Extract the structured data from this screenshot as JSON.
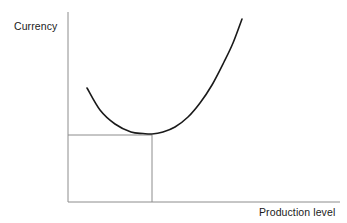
{
  "figure": {
    "background_color": "#ffffff",
    "width": 347,
    "height": 223
  },
  "labels": {
    "y_axis": "Currency",
    "x_axis": "Production level"
  },
  "chart_data": {
    "type": "line",
    "title": "",
    "subtitle": "",
    "xlabel": "Production level",
    "ylabel": "Currency",
    "grid": false,
    "legend": null,
    "tick_labels": {
      "x": [],
      "y": []
    },
    "axis_style": {
      "color": "#8c8c8c",
      "width_px": 1,
      "x_axis_pixels": {
        "x1": 68,
        "y1": 202,
        "x2": 340,
        "y2": 202
      },
      "y_axis_pixels": {
        "x1": 68,
        "y1": 12,
        "x2": 68,
        "y2": 202
      }
    },
    "xlim": [
      0,
      10
    ],
    "ylim": [
      0,
      10
    ],
    "series": [
      {
        "name": "Average total cost",
        "color": "#1a1a1a",
        "width_px": 1.6,
        "shape": "u-curve",
        "x": [
          0.7,
          1.1,
          1.55,
          2.05,
          2.55,
          3.05,
          3.55,
          4.0,
          4.5,
          5.0,
          5.5,
          6.0,
          6.4,
          6.8,
          7.2,
          7.6
        ],
        "y": [
          6.0,
          4.85,
          4.0,
          3.4,
          3.0,
          2.75,
          2.58,
          2.5,
          2.52,
          2.7,
          3.05,
          3.7,
          4.45,
          5.45,
          6.8,
          8.6
        ],
        "pixel_points": [
          [
            87,
            88
          ],
          [
            100,
            110
          ],
          [
            115,
            124
          ],
          [
            131,
            132
          ],
          [
            143,
            133.5
          ],
          [
            152,
            134
          ],
          [
            163,
            132
          ],
          [
            175,
            127
          ],
          [
            188,
            117
          ],
          [
            200,
            103
          ],
          [
            212,
            85
          ],
          [
            224,
            62
          ],
          [
            233,
            43
          ],
          [
            242,
            19
          ]
        ]
      }
    ],
    "annotations": [
      {
        "name": "minimum-reference-lines",
        "description": "Dropline from curve minimum to x-axis and horizontal line from minimum to y-axis",
        "color": "#8c8c8c",
        "width_px": 1,
        "minimum_point_pixels": {
          "x": 152,
          "y": 134
        },
        "horizontal_line_pixels": {
          "x1": 68,
          "y1": 135,
          "x2": 152,
          "y2": 135
        },
        "vertical_line_pixels": {
          "x1": 152,
          "y1": 135,
          "x2": 152,
          "y2": 202
        }
      }
    ]
  }
}
